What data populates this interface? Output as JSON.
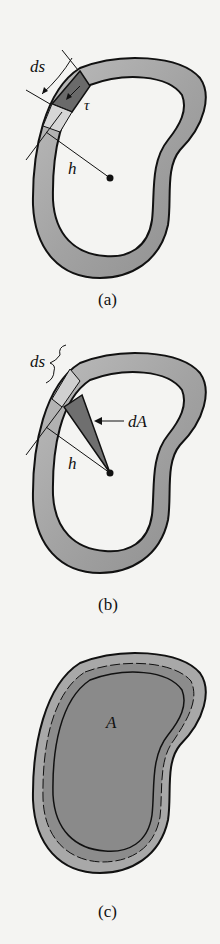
{
  "figure": {
    "panels": [
      {
        "id": "a",
        "caption": "(a)",
        "labels": {
          "ds": "ds",
          "tau": "τ",
          "h": "h"
        }
      },
      {
        "id": "b",
        "caption": "(b)",
        "labels": {
          "ds": "ds",
          "dA": "dA",
          "h": "h"
        }
      },
      {
        "id": "c",
        "caption": "(c)",
        "labels": {
          "A": "A"
        }
      }
    ]
  },
  "colors": {
    "background": "#f4f4f2",
    "wall": "#9a9a9a",
    "wall_light": "#c8c8c8",
    "element": "#6a6a6a",
    "enclosed_area": "#8c8c8c",
    "outline": "#111111"
  }
}
